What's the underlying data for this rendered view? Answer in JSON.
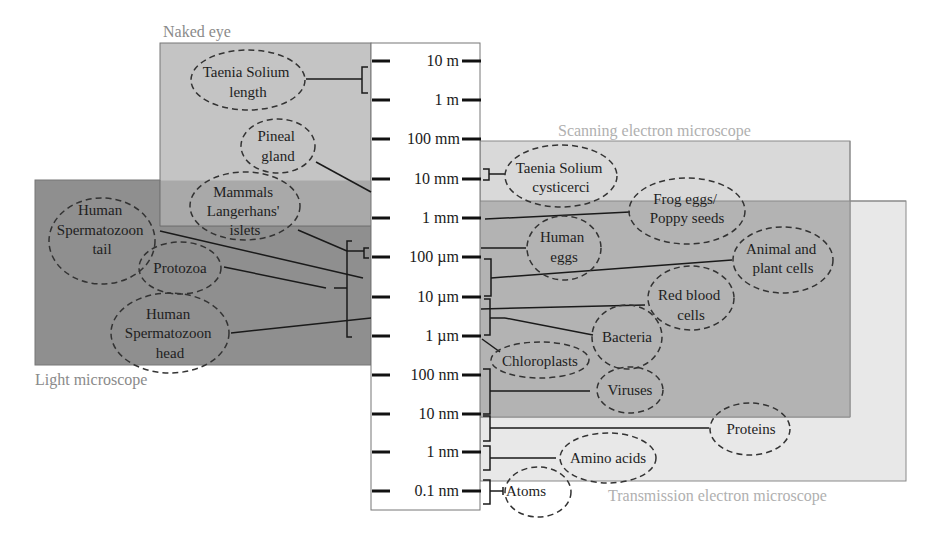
{
  "diagram": {
    "regions": [
      {
        "id": "naked-eye",
        "label": "Naked eye",
        "color": "#c4c4c4"
      },
      {
        "id": "light-microscope",
        "label": "Light microscope",
        "color": "#8f8f8f"
      },
      {
        "id": "sem",
        "label": "Scanning electron microscope",
        "color": "#d9d9d9"
      },
      {
        "id": "tem",
        "label": "Transmission electron microscope",
        "color": "#e8e8e8"
      },
      {
        "id": "sem-tem-overlap",
        "label": "",
        "color": "#b3b3b3"
      }
    ],
    "scale_ticks": [
      "10 m",
      "1 m",
      "100 mm",
      "10 mm",
      "1 mm",
      "100 µm",
      "10 µm",
      "1 µm",
      "100 nm",
      "10 nm",
      "1 nm",
      "0.1 nm"
    ],
    "objects": {
      "taenia_length": [
        "Taenia Solium",
        "length"
      ],
      "pineal": [
        "Pineal",
        "gland"
      ],
      "mammals": [
        "Mammals",
        "Langerhans'",
        "islets"
      ],
      "sperm_tail": [
        "Human",
        "Spermatozoon",
        "tail"
      ],
      "protozoa": [
        "Protozoa"
      ],
      "sperm_head": [
        "Human",
        "Spermatozoon",
        "head"
      ],
      "taenia_cysticerci": [
        "Taenia Solium",
        "cysticerci"
      ],
      "frog_eggs": [
        "Frog eggs/",
        "Poppy seeds"
      ],
      "human_eggs": [
        "Human",
        "eggs"
      ],
      "animal_plant": [
        "Animal and",
        "plant cells"
      ],
      "red_blood": [
        "Red blood",
        "cells"
      ],
      "bacteria": [
        "Bacteria"
      ],
      "chloroplasts": [
        "Chloroplasts"
      ],
      "viruses": [
        "Viruses"
      ],
      "proteins": [
        "Proteins"
      ],
      "amino_acids": [
        "Amino acids"
      ],
      "atoms": [
        "Atoms"
      ]
    }
  }
}
